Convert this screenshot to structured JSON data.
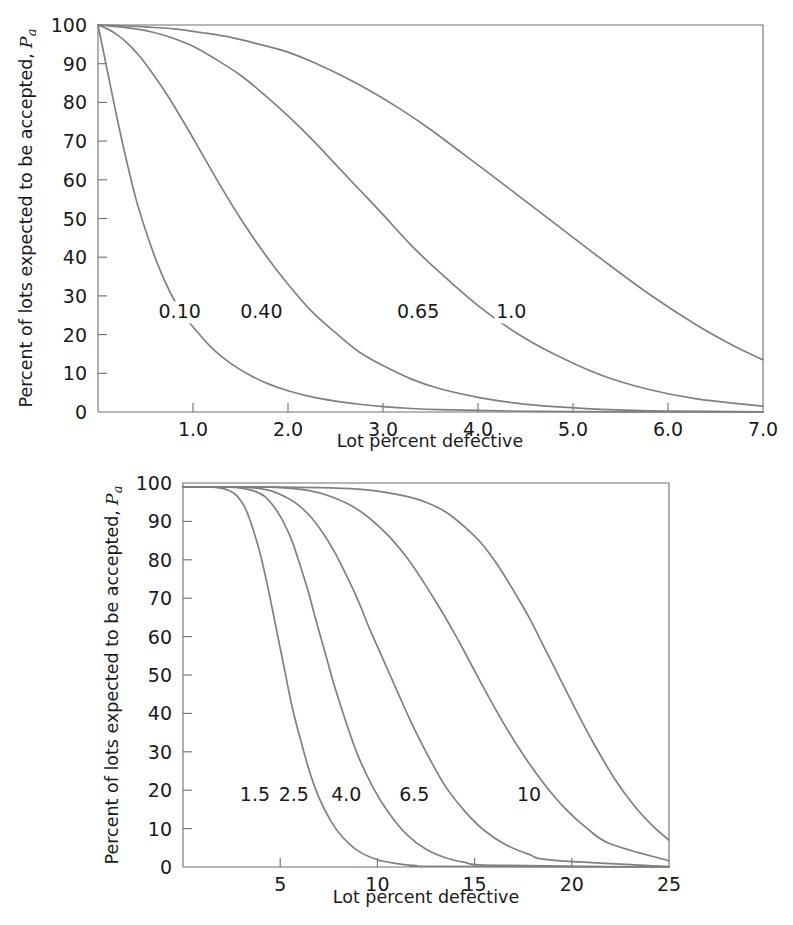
{
  "figure": {
    "background_color": "#ffffff",
    "curve_color": "#808080",
    "axis_color": "#6f6f6f",
    "text_color": "#1a1a1a"
  },
  "chart_data": [
    {
      "id": "top",
      "type": "line",
      "title": "",
      "xlabel": "Lot percent defective",
      "ylabel": "Percent of lots expected to be accepted, Pa",
      "ylabel_main": "Percent of lots expected to be accepted,",
      "ylabel_symbol": "P",
      "ylabel_subscript": "a",
      "xlim": [
        0,
        7
      ],
      "ylim": [
        0,
        100
      ],
      "xticks": [
        1.0,
        2.0,
        3.0,
        4.0,
        5.0,
        6.0,
        7.0
      ],
      "xticklabels": [
        "1.0",
        "2.0",
        "3.0",
        "4.0",
        "5.0",
        "6.0",
        "7.0"
      ],
      "yticks": [
        0,
        10,
        20,
        30,
        40,
        50,
        60,
        70,
        80,
        90,
        100
      ],
      "yticklabels": [
        "0",
        "10",
        "20",
        "30",
        "40",
        "50",
        "60",
        "70",
        "80",
        "90",
        "100"
      ],
      "grid": false,
      "legend_position": "inline-curve-labels",
      "series": [
        {
          "name": "0.10",
          "label": "0.10",
          "label_x": 0.86,
          "label_y": 26,
          "x": [
            0.0,
            0.1,
            0.2,
            0.3,
            0.4,
            0.5,
            0.6,
            0.7,
            0.8,
            0.9,
            1.0,
            1.2,
            1.4,
            1.6,
            1.8,
            2.0,
            2.25,
            2.5,
            2.75,
            3.0,
            3.3,
            3.6,
            4.0,
            4.5,
            5.0,
            6.0,
            7.0
          ],
          "values": [
            100,
            88,
            76,
            65,
            55,
            47,
            40,
            34,
            29,
            25,
            22,
            16.5,
            12.5,
            9.5,
            7.2,
            5.5,
            3.9,
            2.8,
            2.0,
            1.4,
            0.9,
            0.6,
            0.4,
            0.2,
            0.1,
            0.04,
            0.0
          ]
        },
        {
          "name": "0.40",
          "label": "0.40",
          "label_x": 1.72,
          "label_y": 26,
          "x": [
            0.0,
            0.1,
            0.2,
            0.3,
            0.4,
            0.5,
            0.7,
            0.9,
            1.1,
            1.3,
            1.5,
            1.75,
            2.0,
            2.25,
            2.5,
            2.75,
            3.0,
            3.3,
            3.6,
            4.0,
            4.4,
            4.8,
            5.3,
            6.0,
            7.0
          ],
          "values": [
            100,
            99,
            97.5,
            95.5,
            93,
            90,
            83,
            75,
            66.5,
            58,
            50,
            41,
            33,
            26,
            20.5,
            15.5,
            12,
            8.5,
            6.0,
            3.8,
            2.3,
            1.4,
            0.7,
            0.25,
            0.05
          ]
        },
        {
          "name": "0.65",
          "label": "0.65",
          "label_x": 3.37,
          "label_y": 26,
          "x": [
            0.0,
            0.2,
            0.4,
            0.6,
            0.8,
            1.0,
            1.25,
            1.5,
            1.75,
            2.0,
            2.25,
            2.5,
            2.75,
            3.0,
            3.3,
            3.6,
            4.0,
            4.4,
            4.8,
            5.3,
            5.8,
            6.3,
            7.0
          ],
          "values": [
            100,
            99.6,
            99,
            98,
            96.5,
            94.5,
            91,
            87,
            82,
            76.5,
            70.5,
            64,
            57.5,
            51,
            43,
            36,
            27.5,
            20.5,
            15,
            9.5,
            5.8,
            3.4,
            1.5
          ]
        },
        {
          "name": "1.0",
          "label": "1.0",
          "label_x": 4.35,
          "label_y": 26,
          "x": [
            0.0,
            0.25,
            0.5,
            0.8,
            1.1,
            1.4,
            1.7,
            2.0,
            2.3,
            2.6,
            2.9,
            3.2,
            3.5,
            3.8,
            4.1,
            4.5,
            4.9,
            5.3,
            5.8,
            6.3,
            6.7,
            7.0
          ],
          "values": [
            100,
            99.8,
            99.5,
            99,
            98,
            96.8,
            95,
            93,
            90,
            86.5,
            82.5,
            78,
            73,
            67.5,
            62,
            54.5,
            47,
            39.5,
            30.5,
            22.5,
            17.0,
            13.5
          ]
        }
      ]
    },
    {
      "id": "bottom",
      "type": "line",
      "title": "",
      "xlabel": "Lot percent defective",
      "ylabel": "Percent of lots expected to be accepted, Pa",
      "ylabel_main": "Percent of lots expected to be accepted,",
      "ylabel_symbol": "P",
      "ylabel_subscript": "a",
      "xlim": [
        0,
        25
      ],
      "ylim": [
        0,
        100
      ],
      "xticks": [
        5,
        10,
        15,
        20,
        25
      ],
      "xticklabels": [
        "5",
        "10",
        "15",
        "20",
        "25"
      ],
      "yticks": [
        0,
        10,
        20,
        30,
        40,
        50,
        60,
        70,
        80,
        90,
        100
      ],
      "yticklabels": [
        "0",
        "10",
        "20",
        "30",
        "40",
        "50",
        "60",
        "70",
        "80",
        "90",
        "100"
      ],
      "grid": false,
      "legend_position": "inline-curve-labels",
      "series": [
        {
          "name": "1.5",
          "label": "1.5",
          "label_x": 3.7,
          "label_y": 19,
          "x": [
            0.0,
            1.0,
            1.8,
            2.4,
            2.8,
            3.2,
            3.6,
            4.0,
            4.4,
            4.8,
            5.2,
            5.6,
            6.0,
            6.5,
            7.0,
            7.6,
            8.2,
            9.0,
            10.0,
            11.0,
            12.0,
            12.8,
            25.0
          ],
          "values": [
            99,
            99,
            98.8,
            98,
            96.5,
            93.5,
            88,
            81,
            72,
            62,
            52,
            42,
            34,
            25,
            18,
            12,
            7.8,
            4.2,
            1.9,
            0.9,
            0.35,
            0.2,
            0.0
          ]
        },
        {
          "name": "2.5",
          "label": "2.5",
          "label_x": 5.7,
          "label_y": 19,
          "x": [
            0.0,
            1.5,
            2.8,
            3.6,
            4.2,
            4.8,
            5.2,
            5.6,
            6.0,
            6.4,
            6.8,
            7.3,
            7.8,
            8.4,
            9.0,
            9.8,
            10.6,
            11.5,
            12.5,
            13.5,
            14.5,
            16.0,
            25.0
          ],
          "values": [
            99,
            99,
            98.8,
            98,
            96.5,
            93,
            89.5,
            85,
            79,
            72.5,
            65,
            56,
            47,
            37.5,
            29,
            20.5,
            14,
            8.5,
            4.6,
            2.4,
            1.2,
            0.45,
            0.0
          ]
        },
        {
          "name": "4.0",
          "label": "4.0",
          "label_x": 8.4,
          "label_y": 19,
          "x": [
            0.0,
            2.0,
            3.5,
            4.5,
            5.4,
            6.0,
            6.6,
            7.2,
            7.8,
            8.4,
            9.0,
            9.6,
            10.3,
            11.0,
            11.8,
            12.6,
            13.5,
            14.5,
            15.5,
            16.6,
            17.8,
            19.0,
            25.0
          ],
          "values": [
            99,
            99,
            98.8,
            98,
            96,
            94,
            91,
            87,
            82,
            76,
            69.5,
            62,
            54,
            46,
            37,
            29,
            21,
            14.5,
            9.5,
            5.8,
            3.3,
            1.8,
            0.1
          ]
        },
        {
          "name": "6.5",
          "label": "6.5",
          "label_x": 11.9,
          "label_y": 19,
          "x": [
            0.0,
            3.0,
            5.0,
            6.5,
            7.6,
            8.5,
            9.3,
            10.0,
            10.8,
            11.6,
            12.4,
            13.2,
            14.0,
            14.8,
            15.7,
            16.6,
            17.6,
            18.6,
            19.7,
            20.8,
            22.0,
            25.0
          ],
          "values": [
            99,
            99,
            98.8,
            98,
            96.5,
            94.5,
            92,
            89,
            85,
            80,
            74,
            67.5,
            60.5,
            53,
            44.5,
            36.5,
            28.5,
            21.5,
            15.0,
            10.0,
            6.0,
            1.6
          ]
        },
        {
          "name": "10",
          "label": "10",
          "label_x": 17.8,
          "label_y": 19,
          "x": [
            0.0,
            4.0,
            7.0,
            9.0,
            10.5,
            11.5,
            12.5,
            13.5,
            14.5,
            15.4,
            16.2,
            17.0,
            17.8,
            18.6,
            19.4,
            20.3,
            21.2,
            22.2,
            23.2,
            24.2,
            25.0
          ],
          "values": [
            99,
            99,
            98.8,
            98.4,
            97.5,
            96.5,
            95,
            92.5,
            88.5,
            84,
            78.5,
            72,
            65,
            57,
            49,
            40,
            31.5,
            23,
            16,
            10.5,
            7.0
          ]
        }
      ]
    }
  ]
}
